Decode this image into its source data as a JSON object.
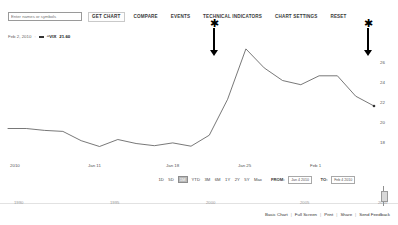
{
  "toolbar": {
    "symbol_input_placeholder": "Enter names or symbols",
    "symbol_input_value": "",
    "get_chart_label": "GET CHART",
    "compare_label": "COMPARE",
    "events_label": "EVENTS",
    "technical_indicators_label": "TECHNICAL INDICATORS",
    "chart_settings_label": "CHART SETTINGS",
    "reset_label": "RESET"
  },
  "quote": {
    "date": "Feb 2, 2010",
    "separator": ":",
    "symbol": "^VIX",
    "value": "21.60"
  },
  "annotations": [
    {
      "name": "annotation-arrow-technical-indicators",
      "glyph": "star"
    },
    {
      "name": "annotation-arrow-latest-price",
      "glyph": "star"
    }
  ],
  "range_controls": {
    "buttons": [
      "1D",
      "5D",
      "1M",
      "YTD",
      "3M",
      "6M",
      "1Y",
      "2Y",
      "5Y",
      "Max"
    ],
    "active": "1M",
    "from_label": "FROM:",
    "from_value": "Jan 4 2010",
    "to_label": "TO:",
    "to_value": "Feb 4 2010"
  },
  "navigator": {
    "years": [
      "1990",
      "1995",
      "2000",
      "2005",
      "2010"
    ]
  },
  "footer": {
    "links": [
      "Basic Chart",
      "Full Screen",
      "Print",
      "Share",
      "Send Feedback"
    ],
    "separator": "|"
  },
  "chart_data": {
    "type": "line",
    "title": "",
    "xlabel": "",
    "ylabel": "",
    "series_name": "^VIX",
    "line_color": "#555555",
    "grid": false,
    "legend_position": "top-left",
    "ylim": [
      17.2,
      27.0
    ],
    "yticks": [
      26,
      24,
      22,
      20,
      18
    ],
    "xtick_labels": [
      "2010",
      "Jan 11",
      "Jan 18",
      "Jan 25",
      "Feb 1"
    ],
    "x": [
      "Jan 4",
      "Jan 5",
      "Jan 6",
      "Jan 7",
      "Jan 8",
      "Jan 11",
      "Jan 12",
      "Jan 13",
      "Jan 14",
      "Jan 15",
      "Jan 19",
      "Jan 20",
      "Jan 21",
      "Jan 22",
      "Jan 25",
      "Jan 26",
      "Jan 27",
      "Jan 28",
      "Jan 29",
      "Feb 1",
      "Feb 2"
    ],
    "values": [
      19.35,
      19.35,
      19.16,
      19.06,
      18.13,
      17.55,
      18.25,
      17.85,
      17.63,
      17.91,
      17.58,
      18.68,
      22.27,
      27.31,
      25.41,
      24.15,
      23.73,
      24.62,
      24.62,
      22.58,
      21.6
    ],
    "annotated_points": [
      {
        "x": "Jan 22",
        "y": 27.31,
        "note": "peak marked with arrow"
      },
      {
        "x": "Feb 2",
        "y": 21.6,
        "note": "latest point marked with arrow"
      }
    ]
  }
}
